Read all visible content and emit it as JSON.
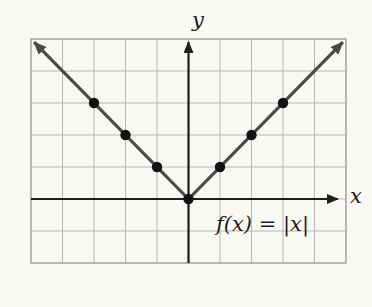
{
  "figure": {
    "background_color": "#faf8f4",
    "grid_line_color": "#b6b6b6",
    "grid_border_color": "#a2a2a2",
    "axis_color": "#1e1e1e",
    "curve_color": "#4a4a4a",
    "point_color": "#121212",
    "text_color": "#1c1c1c"
  },
  "chart_data": {
    "type": "line",
    "equation_label": "f(x) = |x|",
    "xlabel": "x",
    "ylabel": "y",
    "xlim": [
      -5,
      5
    ],
    "ylim": [
      -2,
      5
    ],
    "grid": true,
    "grid_step": 1,
    "series": [
      {
        "name": "f(x) = |x|",
        "x": [
          -5,
          0,
          5
        ],
        "y": [
          5,
          0,
          5
        ],
        "arrow_ends": true
      }
    ],
    "marked_points": [
      [
        -3,
        3
      ],
      [
        -2,
        2
      ],
      [
        -1,
        1
      ],
      [
        0,
        0
      ],
      [
        1,
        1
      ],
      [
        2,
        2
      ],
      [
        3,
        3
      ]
    ]
  }
}
